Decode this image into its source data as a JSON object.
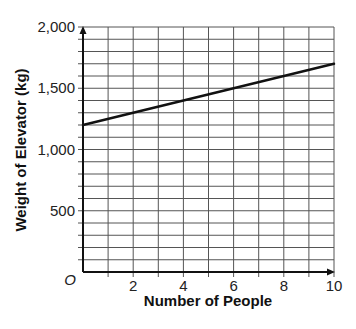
{
  "chart_data": {
    "type": "line",
    "title": "",
    "xlabel": "Number of People",
    "ylabel": "Weight of Elevator (kg)",
    "xlim": [
      0,
      10
    ],
    "ylim": [
      0,
      2000
    ],
    "x_ticks": [
      2,
      4,
      6,
      8,
      10
    ],
    "x_tick_labels": [
      "2",
      "4",
      "6",
      "8",
      "10"
    ],
    "x_minor_step": 1,
    "y_ticks": [
      500,
      1000,
      1500,
      2000
    ],
    "y_tick_labels": [
      "500",
      "1,000",
      "1,500",
      "2,000"
    ],
    "y_minor_step": 100,
    "origin_label": "O",
    "grid": true,
    "series": [
      {
        "name": "Weight of Elevator",
        "x": [
          0,
          10
        ],
        "y": [
          1200,
          1700
        ]
      }
    ],
    "colors": {
      "line": "#111111",
      "grid": "#555555",
      "axis": "#111111"
    }
  }
}
